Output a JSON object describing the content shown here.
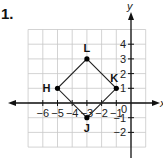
{
  "problem": {
    "number_label": "1."
  },
  "graph": {
    "x_axis_label": "x",
    "y_axis_label": "y",
    "origin_label": "0",
    "x_range": [
      -7,
      1
    ],
    "y_range": [
      -3,
      5
    ],
    "x_tick_labels": [
      "−6",
      "−5",
      "−4",
      "−3",
      "−2",
      "−1"
    ],
    "x_tick_values": [
      -6,
      -5,
      -4,
      -3,
      -2,
      -1
    ],
    "y_tick_labels": [
      "4",
      "3",
      "2",
      "1",
      "−1",
      "−2"
    ],
    "y_tick_values": [
      4,
      3,
      2,
      1,
      -1,
      -2
    ],
    "grid": true,
    "colors": {
      "grid": "#c8c8c8",
      "axis": "#111111",
      "shape": "#222222",
      "point": "#000000"
    }
  },
  "shape": {
    "type": "square",
    "points": [
      {
        "name": "L",
        "x": -3,
        "y": 3
      },
      {
        "name": "K",
        "x": -1,
        "y": 1
      },
      {
        "name": "J",
        "x": -3,
        "y": -1
      },
      {
        "name": "H",
        "x": -5,
        "y": 1
      }
    ]
  }
}
